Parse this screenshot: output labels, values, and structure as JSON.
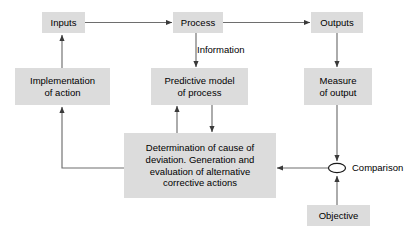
{
  "diagram": {
    "background_color": "#ffffff",
    "node_fill_color": "#dcdcdc",
    "line_color": "#3a3a3a",
    "text_color": "#000000",
    "nodes": [
      {
        "id": "inputs",
        "label": "Inputs",
        "shape": "rectangle"
      },
      {
        "id": "process",
        "label": "Process",
        "shape": "rectangle"
      },
      {
        "id": "outputs",
        "label": "Outputs",
        "shape": "rectangle"
      },
      {
        "id": "implementation",
        "label": "Implementation\nof action",
        "shape": "rectangle"
      },
      {
        "id": "predictive",
        "label": "Predictive model\nof process",
        "shape": "rectangle"
      },
      {
        "id": "measure",
        "label": "Measure\nof output",
        "shape": "rectangle"
      },
      {
        "id": "determination",
        "label": "Determination of cause of\ndeviation. Generation and\nevaluation of alternative\ncorrective actions",
        "shape": "rectangle"
      },
      {
        "id": "objective",
        "label": "Objective",
        "shape": "rectangle"
      },
      {
        "id": "comparison",
        "label": "Comparison",
        "shape": "ellipse"
      }
    ],
    "edge_labels": [
      {
        "id": "information",
        "label": "Information"
      }
    ],
    "edges": [
      {
        "from": "inputs",
        "to": "process",
        "style": "arrow"
      },
      {
        "from": "process",
        "to": "outputs",
        "style": "arrow"
      },
      {
        "from": "process",
        "to": "predictive",
        "style": "arrow",
        "label": "Information"
      },
      {
        "from": "outputs",
        "to": "measure",
        "style": "arrow"
      },
      {
        "from": "measure",
        "to": "comparison",
        "style": "arrow"
      },
      {
        "from": "objective",
        "to": "comparison",
        "style": "arrow"
      },
      {
        "from": "comparison",
        "to": "determination",
        "style": "arrow"
      },
      {
        "from": "predictive",
        "to": "determination",
        "style": "arrow"
      },
      {
        "from": "determination",
        "to": "predictive",
        "style": "arrow"
      },
      {
        "from": "determination",
        "to": "implementation",
        "style": "arrow"
      },
      {
        "from": "implementation",
        "to": "inputs",
        "style": "arrow"
      }
    ]
  }
}
